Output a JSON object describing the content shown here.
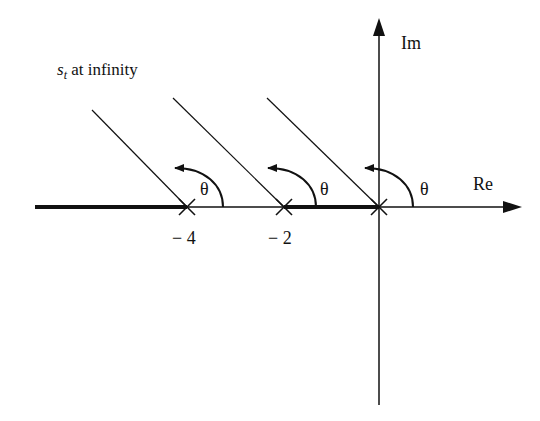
{
  "diagram": {
    "type": "root-locus-asymptotes",
    "caption": {
      "symbol": "s",
      "subscript": "t",
      "text": " at infinity"
    },
    "axes": {
      "real_label": "Re",
      "imag_label": "Im"
    },
    "poles": [
      {
        "label": "− 4",
        "value": -4
      },
      {
        "label": "− 2",
        "value": -2
      },
      {
        "label": "",
        "value": 0
      }
    ],
    "angle_label": "θ",
    "angle_labels": [
      "θ",
      "θ",
      "θ"
    ],
    "colors": {
      "ink": "#111111",
      "background": "#ffffff"
    }
  }
}
